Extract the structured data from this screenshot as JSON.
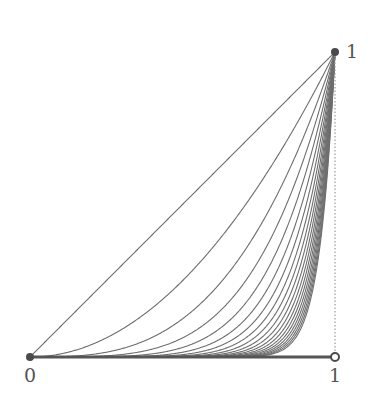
{
  "chart_data": {
    "type": "line",
    "title": "",
    "xlabel": "",
    "ylabel": "",
    "xlim": [
      0,
      1
    ],
    "ylim": [
      0,
      1
    ],
    "grid": false,
    "legend": null,
    "tick_labels": {
      "x_start": "0",
      "x_end": "1",
      "y_top": "1"
    },
    "series": [
      {
        "name": "x^1",
        "exponent": 1
      },
      {
        "name": "x^2",
        "exponent": 2
      },
      {
        "name": "x^3",
        "exponent": 3
      },
      {
        "name": "x^4",
        "exponent": 4
      },
      {
        "name": "x^5",
        "exponent": 5
      },
      {
        "name": "x^6",
        "exponent": 6
      },
      {
        "name": "x^7",
        "exponent": 7
      },
      {
        "name": "x^8",
        "exponent": 8
      },
      {
        "name": "x^9",
        "exponent": 9
      },
      {
        "name": "x^10",
        "exponent": 10
      },
      {
        "name": "x^11",
        "exponent": 11
      },
      {
        "name": "x^12",
        "exponent": 12
      },
      {
        "name": "x^13",
        "exponent": 13
      },
      {
        "name": "x^14",
        "exponent": 14
      },
      {
        "name": "x^15",
        "exponent": 15
      },
      {
        "name": "x^16",
        "exponent": 16
      },
      {
        "name": "x^17",
        "exponent": 17
      },
      {
        "name": "x^18",
        "exponent": 18
      },
      {
        "name": "x^19",
        "exponent": 19
      },
      {
        "name": "x^20",
        "exponent": 20
      }
    ],
    "annotations": [
      {
        "type": "point",
        "x": 0,
        "y": 0,
        "style": "filled"
      },
      {
        "type": "point",
        "x": 1,
        "y": 1,
        "style": "filled"
      },
      {
        "type": "point",
        "x": 1,
        "y": 0,
        "style": "open"
      },
      {
        "type": "segment",
        "from": [
          0,
          0
        ],
        "to": [
          1,
          0
        ],
        "style": "thick"
      },
      {
        "type": "segment",
        "from": [
          1,
          0
        ],
        "to": [
          1,
          1
        ],
        "style": "dotted"
      }
    ]
  },
  "layout": {
    "origin_px": [
      30,
      357
    ],
    "unit_px": 305,
    "colors": {
      "curve": "#6e6e6e",
      "axis": "#555555",
      "point": "#4a4a4a",
      "dotted": "#9a9a9a"
    }
  }
}
